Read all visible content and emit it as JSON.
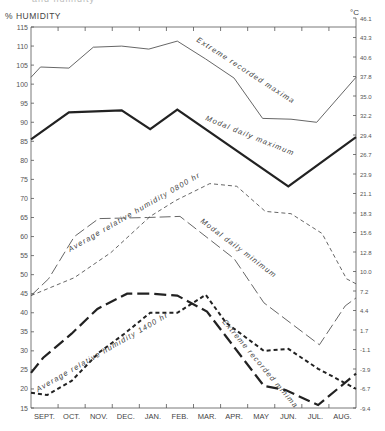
{
  "header": {
    "cut_title": "and humidity",
    "left_axis_label": "% HUMIDITY",
    "right_axis_label": "°C"
  },
  "chart_data": {
    "type": "line",
    "title": "",
    "xlabel": "",
    "ylabel": "% HUMIDITY",
    "y2label": "°C",
    "ylim": [
      15,
      115
    ],
    "y2lim": [
      -9.4,
      46.1
    ],
    "grid": false,
    "legend_position": "inline labels along lines",
    "categories": [
      "SEPT.",
      "OCT.",
      "NOV.",
      "DEC.",
      "JAN.",
      "FEB.",
      "MAR.",
      "APR.",
      "MAY",
      "JUN.",
      "JUL.",
      "AUG."
    ],
    "y_ticks": [
      15,
      20,
      25,
      30,
      35,
      40,
      45,
      50,
      55,
      60,
      65,
      70,
      75,
      80,
      85,
      90,
      95,
      100,
      105,
      110,
      115
    ],
    "y2_ticks": [
      46.1,
      43.3,
      40.6,
      37.8,
      35.0,
      32.2,
      29.4,
      26.7,
      23.9,
      21.1,
      18.3,
      15.6,
      12.8,
      10.0,
      7.2,
      4.4,
      1.7,
      -1.1,
      -3.9,
      -6.7,
      -9.4
    ],
    "series": [
      {
        "name": "Extreme recorded maxima",
        "axis": "temperature",
        "style": "thin-solid",
        "points": [
          [
            0.0,
            101.8
          ],
          [
            0.35,
            104.5
          ],
          [
            1.4,
            104.2
          ],
          [
            2.3,
            109.7
          ],
          [
            3.35,
            110.0
          ],
          [
            4.35,
            109.2
          ],
          [
            5.4,
            111.3
          ],
          [
            6.45,
            106.6
          ],
          [
            7.5,
            101.6
          ],
          [
            8.55,
            91.0
          ],
          [
            9.6,
            90.8
          ],
          [
            10.55,
            90.0
          ],
          [
            12.0,
            101.8
          ]
        ]
      },
      {
        "name": "Modal daily maximum",
        "axis": "temperature",
        "style": "thick-solid",
        "points": [
          [
            0.0,
            85.5
          ],
          [
            1.4,
            92.6
          ],
          [
            3.35,
            93.1
          ],
          [
            4.4,
            88.2
          ],
          [
            5.4,
            93.3
          ],
          [
            9.5,
            73.2
          ],
          [
            12.0,
            86.1
          ]
        ]
      },
      {
        "name": "Average relative humidity 0800 hr",
        "axis": "humidity",
        "style": "short-dash",
        "points": [
          [
            0.0,
            44.5
          ],
          [
            1.6,
            49.2
          ],
          [
            2.95,
            55.8
          ],
          [
            4.4,
            65.3
          ],
          [
            5.35,
            69.5
          ],
          [
            6.6,
            73.9
          ],
          [
            7.6,
            73.2
          ],
          [
            8.65,
            66.6
          ],
          [
            9.6,
            66.0
          ],
          [
            10.75,
            60.8
          ],
          [
            11.65,
            48.9
          ],
          [
            12.0,
            47.6
          ]
        ]
      },
      {
        "name": "Modal daily minimum",
        "axis": "temperature",
        "style": "long-dash-thin",
        "points": [
          [
            0.0,
            44.5
          ],
          [
            0.65,
            48.9
          ],
          [
            1.6,
            60.0
          ],
          [
            2.5,
            64.7
          ],
          [
            4.3,
            65.0
          ],
          [
            5.5,
            65.3
          ],
          [
            7.5,
            54.2
          ],
          [
            8.6,
            42.6
          ],
          [
            10.65,
            31.6
          ],
          [
            11.6,
            41.8
          ],
          [
            12.0,
            43.9
          ]
        ]
      },
      {
        "name": "Average relative humidity 1400 hr",
        "axis": "humidity",
        "style": "thick-short-dash",
        "points": [
          [
            0.0,
            19.0
          ],
          [
            0.6,
            18.4
          ],
          [
            1.5,
            22.1
          ],
          [
            2.5,
            29.5
          ],
          [
            3.45,
            34.5
          ],
          [
            4.4,
            40.0
          ],
          [
            5.4,
            40.0
          ],
          [
            6.45,
            44.7
          ],
          [
            7.2,
            37.4
          ],
          [
            8.6,
            30.0
          ],
          [
            9.5,
            30.5
          ],
          [
            10.6,
            25.3
          ],
          [
            12.0,
            20.0
          ]
        ]
      },
      {
        "name": "Extreme recorded minima",
        "axis": "temperature",
        "style": "thick-long-dash",
        "points": [
          [
            0.0,
            24.2
          ],
          [
            0.45,
            28.2
          ],
          [
            1.5,
            34.5
          ],
          [
            2.45,
            41.0
          ],
          [
            3.55,
            45.0
          ],
          [
            4.45,
            45.0
          ],
          [
            5.4,
            44.5
          ],
          [
            6.5,
            40.3
          ],
          [
            8.6,
            20.8
          ],
          [
            9.4,
            19.7
          ],
          [
            10.6,
            15.8
          ],
          [
            12.0,
            24.0
          ]
        ]
      }
    ],
    "annotations": [
      {
        "text": "Extreme recorded maxima",
        "series": 0
      },
      {
        "text": "Modal daily maximum",
        "series": 1
      },
      {
        "text": "Average relative humidity 0800 hr",
        "series": 2
      },
      {
        "text": "Modal daily minimum",
        "series": 3
      },
      {
        "text": "Average relative humidity 1400 hr",
        "series": 4
      },
      {
        "text": "Extreme recorded minima",
        "series": 5
      }
    ]
  }
}
